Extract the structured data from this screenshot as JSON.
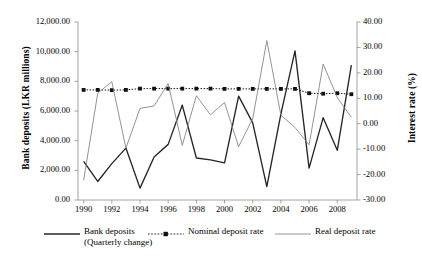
{
  "chart_data": {
    "type": "line",
    "title": "",
    "xlabel": "",
    "ylabel": "Bank deposits (LKR millions)",
    "y2label": "Interest rate (%)",
    "grid": false,
    "legend_position": "bottom",
    "x": [
      1990,
      1991,
      1992,
      1993,
      1994,
      1995,
      1996,
      1997,
      1998,
      1999,
      2000,
      2001,
      2002,
      2003,
      2004,
      2005,
      2006,
      2007,
      2008,
      2009
    ],
    "xtick_labels": [
      "1990",
      "1992",
      "1994",
      "1996",
      "1998",
      "2000",
      "2002",
      "2004",
      "2006",
      "2008"
    ],
    "xtick_values": [
      1990,
      1992,
      1994,
      1996,
      1998,
      2000,
      2002,
      2004,
      2006,
      2008
    ],
    "xlim": [
      1989.6,
      2009.4
    ],
    "ylim": [
      0,
      12000
    ],
    "ytick_labels": [
      "12,000.00",
      "10,000.00",
      "8,000.00",
      "6,000.00",
      "4,000.00",
      "2,000.00",
      "0.00"
    ],
    "ytick_values": [
      12000,
      10000,
      8000,
      6000,
      4000,
      2000,
      0
    ],
    "y2lim": [
      -30,
      40
    ],
    "y2tick_labels": [
      "40.00",
      "30.00",
      "20.00",
      "10.00",
      "0.00",
      "-10.00",
      "-20.00",
      "-30.00"
    ],
    "y2tick_values": [
      40,
      30,
      20,
      10,
      0,
      -10,
      -20,
      -30
    ],
    "series": [
      {
        "name": "Bank deposits (Quarterly change)",
        "axis": "left",
        "color": "#262626",
        "style": "solid",
        "marker": "none",
        "values": [
          2600,
          1250,
          2450,
          3500,
          800,
          2900,
          3750,
          6400,
          2830,
          2700,
          2500,
          7000,
          5200,
          900,
          5800,
          10050,
          2150,
          5550,
          3350,
          9100
        ]
      },
      {
        "name": "Nominal deposit rate",
        "axis": "right",
        "color": "#1a1a1a",
        "style": "dotted",
        "marker": "square",
        "values": [
          13.3,
          13.3,
          13.2,
          13.3,
          13.8,
          13.8,
          13.8,
          13.8,
          13.8,
          13.8,
          13.7,
          13.7,
          13.7,
          13.7,
          13.7,
          13.7,
          12.0,
          11.8,
          12.0,
          11.6
        ]
      },
      {
        "name": "Real deposit rate",
        "axis": "right",
        "color": "#808080",
        "style": "solid",
        "marker": "none",
        "values": [
          -22.3,
          12.0,
          16.5,
          -9.6,
          6.0,
          7.0,
          15.8,
          -8.5,
          11.0,
          3.5,
          8.3,
          -9.0,
          2.0,
          32.7,
          3.4,
          -1.5,
          -8.3,
          23.5,
          10.3,
          2.5
        ]
      }
    ]
  },
  "legend": {
    "entries": [
      {
        "label": "Bank deposits",
        "sublabel": "(Quarterly change)",
        "sample": "solid-line"
      },
      {
        "label": "Nominal deposit rate",
        "sublabel": "",
        "sample": "dotted-line-with-markers"
      },
      {
        "label": "Real deposit rate",
        "sublabel": "",
        "sample": "thin-gray-line"
      }
    ]
  }
}
